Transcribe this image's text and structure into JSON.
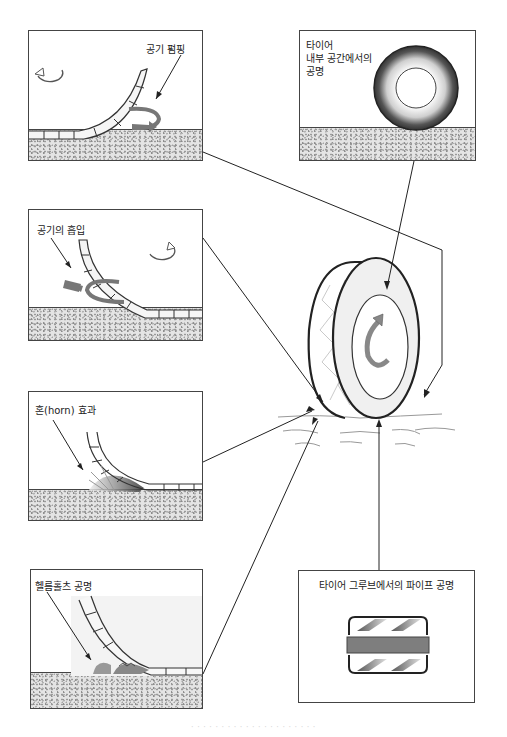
{
  "diagram": {
    "topic": "Tire noise generation mechanisms",
    "colors": {
      "line": "#222222",
      "panel_border": "#444444",
      "ground": "#e4e4e4",
      "arrow_fill": "#7a7a7a"
    },
    "panels": [
      {
        "id": "air-pumping",
        "label": "공기 펌핑"
      },
      {
        "id": "cavity-resonance",
        "label_lines": [
          "타이어",
          "내부 공간에서의",
          "공명"
        ]
      },
      {
        "id": "air-suction",
        "label": "공기의 흡입"
      },
      {
        "id": "horn-effect",
        "label": "혼(horn) 효과"
      },
      {
        "id": "helmholtz-resonance",
        "label": "헬름홀츠 공명"
      },
      {
        "id": "pipe-resonance",
        "label": "타이어 그루브에서의 파이프 공명"
      }
    ],
    "center_object": "tire-on-road",
    "caption": "· · · · · · ·  · · · · ·  · · · · · · · · ·"
  }
}
